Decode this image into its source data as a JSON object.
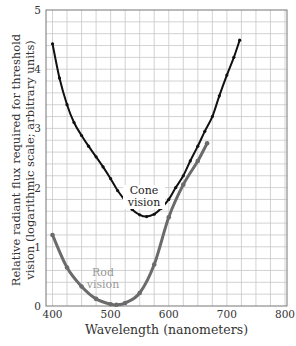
{
  "chart_data": {
    "type": "line",
    "title": "",
    "xlabel": "Wavelength (nanometers)",
    "ylabel": "Relative radiant flux required for threshold vision (logarithmic scale; arbitrary units)",
    "ylabel_lines": [
      "Relative radiant flux required for threshold",
      "vision (logarithmic scale; arbitrary units)"
    ],
    "xlim": [
      400,
      800
    ],
    "ylim": [
      0,
      5
    ],
    "xticks": [
      400,
      500,
      600,
      700,
      800
    ],
    "yticks": [
      0,
      1,
      2,
      3,
      4,
      5
    ],
    "grid": true,
    "grid_x_step": 25,
    "grid_y_step": 0.2,
    "legend": "none (inline annotations)",
    "series": [
      {
        "name": "Cone vision",
        "color": "#111111",
        "x": [
          400,
          412,
          425,
          437,
          450,
          462,
          475,
          487,
          500,
          512,
          525,
          537,
          550,
          562,
          575,
          587,
          600,
          612,
          625,
          637,
          650,
          662,
          675,
          687,
          700,
          712,
          722
        ],
        "values": [
          4.43,
          3.85,
          3.4,
          3.1,
          2.88,
          2.7,
          2.52,
          2.35,
          2.15,
          1.95,
          1.78,
          1.63,
          1.54,
          1.51,
          1.55,
          1.65,
          1.8,
          2.0,
          2.2,
          2.45,
          2.7,
          2.95,
          3.2,
          3.55,
          3.9,
          4.2,
          4.49
        ]
      },
      {
        "name": "Rod vision",
        "color": "#6b6b6b",
        "x": [
          400,
          425,
          450,
          475,
          500,
          510,
          525,
          550,
          575,
          600,
          625,
          650,
          666
        ],
        "values": [
          1.2,
          0.65,
          0.33,
          0.12,
          0.03,
          0.02,
          0.05,
          0.22,
          0.7,
          1.5,
          2.05,
          2.45,
          2.75
        ]
      }
    ],
    "annotations": [
      {
        "text": "Cone\nvision",
        "lines": [
          "Cone",
          "vision"
        ],
        "x": 555,
        "y": 1.8
      },
      {
        "text": "Rod\nvision",
        "lines": [
          "Rod",
          "vision"
        ],
        "x": 488,
        "y": 0.4
      }
    ]
  }
}
